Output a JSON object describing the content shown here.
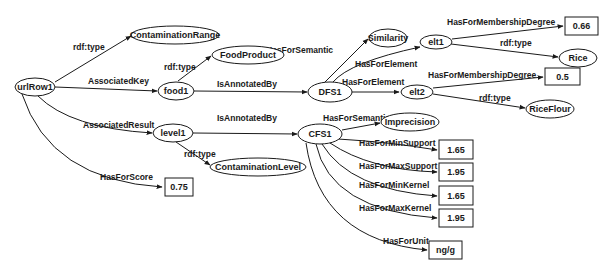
{
  "diagram": {
    "type": "rdf-graph",
    "nodes": {
      "urlRow1": {
        "label": "urlRow1",
        "shape": "ellipse"
      },
      "contaminationRange": {
        "label": "ContaminationRange",
        "shape": "ellipse"
      },
      "foodProduct": {
        "label": "FoodProduct",
        "shape": "ellipse"
      },
      "food1": {
        "label": "food1",
        "shape": "ellipse"
      },
      "dfs1": {
        "label": "DFS1",
        "shape": "ellipse"
      },
      "similarity": {
        "label": "Similarity",
        "shape": "ellipse"
      },
      "elt1": {
        "label": "elt1",
        "shape": "ellipse"
      },
      "val066": {
        "label": "0.66",
        "shape": "rect"
      },
      "rice": {
        "label": "Rice",
        "shape": "ellipse"
      },
      "elt2": {
        "label": "elt2",
        "shape": "ellipse"
      },
      "val05": {
        "label": "0.5",
        "shape": "rect"
      },
      "riceFlour": {
        "label": "RiceFlour",
        "shape": "ellipse"
      },
      "level1": {
        "label": "level1",
        "shape": "ellipse"
      },
      "cfs1": {
        "label": "CFS1",
        "shape": "ellipse"
      },
      "imprecision": {
        "label": "Imprecision",
        "shape": "ellipse"
      },
      "contaminationLevel": {
        "label": "ContaminationLevel",
        "shape": "ellipse"
      },
      "val075": {
        "label": "0.75",
        "shape": "rect"
      },
      "minSupport": {
        "label": "1.65",
        "shape": "rect"
      },
      "maxSupport": {
        "label": "1.95",
        "shape": "rect"
      },
      "minKernel": {
        "label": "1.65",
        "shape": "rect"
      },
      "maxKernel": {
        "label": "1.95",
        "shape": "rect"
      },
      "unit": {
        "label": "ng/g",
        "shape": "rect"
      }
    },
    "edges": {
      "e1": {
        "from": "urlRow1",
        "to": "contaminationRange",
        "label": "rdf:type"
      },
      "e2": {
        "from": "urlRow1",
        "to": "food1",
        "label": "AssociatedKey"
      },
      "e3": {
        "from": "food1",
        "to": "foodProduct",
        "label": "rdf:type"
      },
      "e4": {
        "from": "food1",
        "to": "dfs1",
        "label": "IsAnnotatedBy"
      },
      "e5": {
        "from": "dfs1",
        "to": "similarity",
        "label": "HasForSemantic"
      },
      "e6": {
        "from": "dfs1",
        "to": "elt1",
        "label": "HasForElement"
      },
      "e7": {
        "from": "dfs1",
        "to": "elt2",
        "label": "HasForElement"
      },
      "e8": {
        "from": "elt1",
        "to": "val066",
        "label": "HasForMembershipDegree"
      },
      "e9": {
        "from": "elt1",
        "to": "rice",
        "label": "rdf:type"
      },
      "e10": {
        "from": "elt2",
        "to": "val05",
        "label": "HasForMembershipDegree"
      },
      "e11": {
        "from": "elt2",
        "to": "riceFlour",
        "label": "rdf:type"
      },
      "e12": {
        "from": "urlRow1",
        "to": "level1",
        "label": "AssociatedResult"
      },
      "e13": {
        "from": "level1",
        "to": "cfs1",
        "label": "IsAnnotatedBy"
      },
      "e14": {
        "from": "level1",
        "to": "contaminationLevel",
        "label": "rdf:type"
      },
      "e15": {
        "from": "urlRow1",
        "to": "val075",
        "label": "HasForScore"
      },
      "e16": {
        "from": "cfs1",
        "to": "imprecision",
        "label": "HasForSemantic"
      },
      "e17": {
        "from": "cfs1",
        "to": "minSupport",
        "label": "HasForMinSupport"
      },
      "e18": {
        "from": "cfs1",
        "to": "maxSupport",
        "label": "HasForMaxSupport"
      },
      "e19": {
        "from": "cfs1",
        "to": "minKernel",
        "label": "HasForMinKernel"
      },
      "e20": {
        "from": "cfs1",
        "to": "maxKernel",
        "label": "HasForMaxKernel"
      },
      "e21": {
        "from": "cfs1",
        "to": "unit",
        "label": "HasForUnit"
      }
    }
  }
}
